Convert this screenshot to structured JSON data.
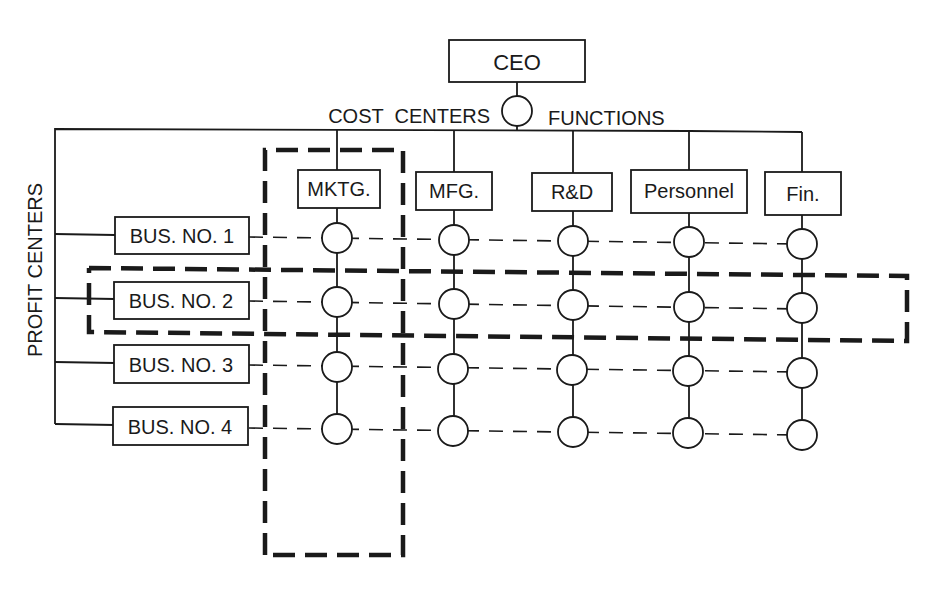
{
  "diagram": {
    "type": "matrix-organization-chart",
    "top": {
      "label": "CEO"
    },
    "axis_labels": {
      "cost_centers": "COST  CENTERS",
      "functions": "FUNCTIONS",
      "profit_centers": "PROFIT CENTERS"
    },
    "functions": [
      {
        "label": "MKTG."
      },
      {
        "label": "MFG."
      },
      {
        "label": "R&D"
      },
      {
        "label": "Personnel"
      },
      {
        "label": "Fin."
      }
    ],
    "businesses": [
      {
        "label": "BUS. NO. 1"
      },
      {
        "label": "BUS. NO. 2"
      },
      {
        "label": "BUS. NO. 3"
      },
      {
        "label": "BUS. NO. 4"
      }
    ],
    "highlights": {
      "column": "MKTG.",
      "row": "BUS. NO. 2"
    },
    "grid": {
      "rows": 4,
      "columns": 5,
      "node_shape": "circle"
    }
  }
}
